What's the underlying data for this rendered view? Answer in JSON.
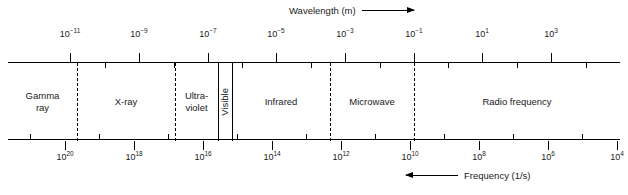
{
  "chart_data": {
    "type": "bar",
    "orientation": "horizontal",
    "top_axis": {
      "label": "Wavelength (m)",
      "arrow": "right",
      "unit": "m",
      "scale": "log10",
      "direction": "increasing-to-the-right",
      "tick_labels": [
        "10−11",
        "10−9",
        "10−7",
        "10−5",
        "10−3",
        "10−1",
        "10¹",
        "10³"
      ],
      "mantissa": "10",
      "exponents": [
        "-11",
        "-9",
        "-7",
        "-5",
        "-3",
        "-1",
        "1",
        "3"
      ],
      "major_ticks": [
        {
          "exponent": -11,
          "x": 70
        },
        {
          "exponent": -9,
          "x": 139
        },
        {
          "exponent": -7,
          "x": 208
        },
        {
          "exponent": -5,
          "x": 276
        },
        {
          "exponent": -3,
          "x": 345
        },
        {
          "exponent": -1,
          "x": 414
        },
        {
          "exponent": 1,
          "x": 482
        },
        {
          "exponent": 3,
          "x": 551
        }
      ],
      "minor_ticks_x": [
        105,
        174,
        242,
        311,
        380,
        448,
        517,
        586
      ]
    },
    "bottom_axis": {
      "label": "Frequency (1/s)",
      "arrow": "left",
      "unit": "1/s",
      "scale": "log10",
      "direction": "decreasing-to-the-right",
      "tick_labels": [
        "10²⁰",
        "10¹⁸",
        "10¹⁶",
        "10¹⁴",
        "10¹²",
        "10¹⁰",
        "10⁸",
        "10⁶",
        "10⁴"
      ],
      "mantissa": "10",
      "exponents": [
        "20",
        "18",
        "16",
        "14",
        "12",
        "10",
        "8",
        "6",
        "4"
      ],
      "major_ticks": [
        {
          "exponent": 20,
          "x": 65
        },
        {
          "exponent": 18,
          "x": 134
        },
        {
          "exponent": 16,
          "x": 203
        },
        {
          "exponent": 14,
          "x": 272
        },
        {
          "exponent": 12,
          "x": 341
        },
        {
          "exponent": 10,
          "x": 410
        },
        {
          "exponent": 8,
          "x": 479
        },
        {
          "exponent": 6,
          "x": 548
        },
        {
          "exponent": 4,
          "x": 617
        }
      ],
      "minor_ticks_x": [
        30,
        99,
        168,
        237,
        306,
        375,
        444,
        513,
        582
      ]
    },
    "bands": [
      {
        "name": "Gamma ray",
        "label_lines": [
          "Gamma",
          "ray"
        ],
        "x_start": 8,
        "x_end": 77,
        "orientation": "horizontal",
        "left_border": "axis-end",
        "right_border": "dashed"
      },
      {
        "name": "X-ray",
        "label_lines": [
          "X-ray"
        ],
        "x_start": 77,
        "x_end": 175,
        "orientation": "horizontal",
        "left_border": "dashed",
        "right_border": "dashed"
      },
      {
        "name": "Ultraviolet",
        "label_lines": [
          "Ultra-",
          "violet"
        ],
        "x_start": 175,
        "x_end": 218,
        "orientation": "horizontal",
        "left_border": "dashed",
        "right_border": "solid"
      },
      {
        "name": "Visible",
        "label_lines": [
          "Visible"
        ],
        "x_start": 218,
        "x_end": 232,
        "orientation": "vertical",
        "left_border": "solid",
        "right_border": "solid"
      },
      {
        "name": "Infrared",
        "label_lines": [
          "Infrared"
        ],
        "x_start": 232,
        "x_end": 330,
        "orientation": "horizontal",
        "left_border": "solid",
        "right_border": "dashed"
      },
      {
        "name": "Microwave",
        "label_lines": [
          "Microwave"
        ],
        "x_start": 330,
        "x_end": 414,
        "orientation": "horizontal",
        "left_border": "dashed",
        "right_border": "dashed"
      },
      {
        "name": "Radio frequency",
        "label_lines": [
          "Radio frequency"
        ],
        "x_start": 414,
        "x_end": 620,
        "orientation": "horizontal",
        "left_border": "dashed",
        "right_border": "axis-end"
      }
    ],
    "dividers": [
      {
        "x": 77,
        "style": "dashed",
        "between": [
          "Gamma ray",
          "X-ray"
        ]
      },
      {
        "x": 175,
        "style": "dashed",
        "between": [
          "X-ray",
          "Ultraviolet"
        ]
      },
      {
        "x": 218,
        "style": "solid",
        "between": [
          "Ultraviolet",
          "Visible"
        ]
      },
      {
        "x": 232,
        "style": "solid",
        "between": [
          "Visible",
          "Infrared"
        ]
      },
      {
        "x": 330,
        "style": "dashed",
        "between": [
          "Infrared",
          "Microwave"
        ]
      },
      {
        "x": 414,
        "style": "dashed",
        "between": [
          "Microwave",
          "Radio frequency"
        ]
      }
    ],
    "grid": false,
    "legend": "none",
    "colors": {
      "line": "#000000",
      "text": "#1a1a1a",
      "background": "#ffffff"
    }
  }
}
